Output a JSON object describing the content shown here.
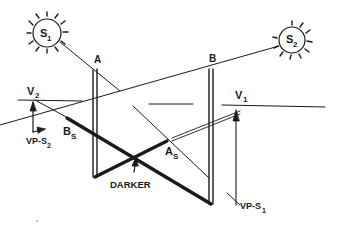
{
  "diagram": {
    "labels": {
      "sun1": "S",
      "sun1_sub": "1",
      "sun2": "S",
      "sun2_sub": "2",
      "pole_a": "A",
      "pole_b": "B",
      "v1": "V",
      "v1_sub": "1",
      "v2": "V",
      "v2_sub": "2",
      "shadow_a": "A",
      "shadow_a_sub": "S",
      "shadow_b": "B",
      "shadow_b_sub": "S",
      "overlap": "DARKER",
      "vp_s1": "VP-S",
      "vp_s1_sub": "1",
      "vp_s2": "VP-S",
      "vp_s2_sub": "2"
    },
    "colors": {
      "ink": "#1a1a1a",
      "paper": "#ffffff"
    }
  }
}
